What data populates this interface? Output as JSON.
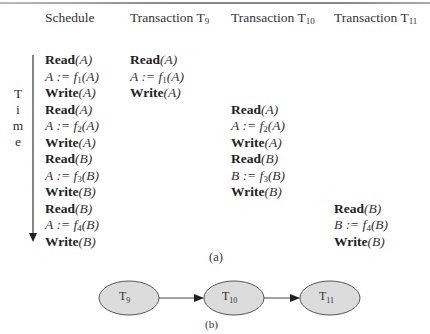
{
  "figure": {
    "part_a": {
      "caption": "(a)",
      "time_axis_label": [
        "T",
        "i",
        "m",
        "e"
      ],
      "columns": [
        {
          "header": "Schedule",
          "sub": ""
        },
        {
          "header": "Transaction T",
          "sub": "9"
        },
        {
          "header": "Transaction T",
          "sub": "10"
        },
        {
          "header": "Transaction T",
          "sub": "11"
        }
      ],
      "schedule": [
        {
          "kind": "op",
          "op": "Read",
          "arg": "(A)"
        },
        {
          "kind": "asg",
          "lhs": "A",
          "fn": "f",
          "sub": "1",
          "arg": "(A)"
        },
        {
          "kind": "op",
          "op": "Write",
          "arg": "(A)"
        },
        {
          "kind": "op",
          "op": "Read",
          "arg": "(A)"
        },
        {
          "kind": "asg",
          "lhs": "A",
          "fn": "f",
          "sub": "2",
          "arg": "(A)"
        },
        {
          "kind": "op",
          "op": "Write",
          "arg": "(A)"
        },
        {
          "kind": "op",
          "op": "Read",
          "arg": "(B)"
        },
        {
          "kind": "asg",
          "lhs": "A",
          "fn": "f",
          "sub": "3",
          "arg": "(B)"
        },
        {
          "kind": "op",
          "op": "Write",
          "arg": "(B)"
        },
        {
          "kind": "op",
          "op": "Read",
          "arg": "(B)"
        },
        {
          "kind": "asg",
          "lhs": "A",
          "fn": "f",
          "sub": "4",
          "arg": "(B)"
        },
        {
          "kind": "op",
          "op": "Write",
          "arg": "(B)"
        }
      ],
      "t9": [
        {
          "kind": "op",
          "op": "Read",
          "arg": "(A)"
        },
        {
          "kind": "asg",
          "lhs": "A",
          "fn": "f",
          "sub": "1",
          "arg": "(A)"
        },
        {
          "kind": "op",
          "op": "Write",
          "arg": "(A)"
        }
      ],
      "t10": [
        {
          "kind": "op",
          "op": "Read",
          "arg": "(A)"
        },
        {
          "kind": "asg",
          "lhs": "A",
          "fn": "f",
          "sub": "2",
          "arg": "(A)"
        },
        {
          "kind": "op",
          "op": "Write",
          "arg": "(A)"
        },
        {
          "kind": "op",
          "op": "Read",
          "arg": "(B)"
        },
        {
          "kind": "asg",
          "lhs": "B",
          "fn": "f",
          "sub": "3",
          "arg": "(B)"
        },
        {
          "kind": "op",
          "op": "Write",
          "arg": "(B)"
        }
      ],
      "t11": [
        {
          "kind": "op",
          "op": "Read",
          "arg": "(B)"
        },
        {
          "kind": "asg",
          "lhs": "B",
          "fn": "f",
          "sub": "4",
          "arg": "(B)"
        },
        {
          "kind": "op",
          "op": "Write",
          "arg": "(B)"
        }
      ]
    },
    "part_b": {
      "caption": "(b)",
      "nodes": [
        {
          "label": "T",
          "sub": "9"
        },
        {
          "label": "T",
          "sub": "10"
        },
        {
          "label": "T",
          "sub": "11"
        }
      ],
      "edges": [
        {
          "from": "T9",
          "to": "T10"
        },
        {
          "from": "T10",
          "to": "T11"
        }
      ],
      "node_fill": "#dcdcdc",
      "node_stroke": "#555555"
    }
  }
}
